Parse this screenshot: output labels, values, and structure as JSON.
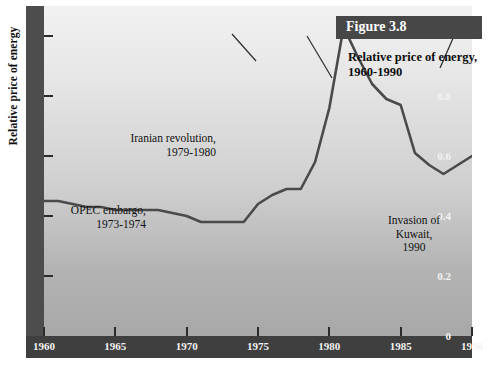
{
  "figure": {
    "tag": "Figure 3.8"
  },
  "chart_data": {
    "type": "line",
    "xlabel": "",
    "ylabel": "Relative price of energy",
    "xlim": [
      1960,
      1990
    ],
    "ylim": [
      0,
      1.1
    ],
    "grid": false,
    "legend": null,
    "y_ticks": [
      "0",
      "0.2",
      "0.4",
      "0.6",
      "0.8",
      "1.0"
    ],
    "y_tick_values": [
      0,
      0.2,
      0.4,
      0.6,
      0.8,
      1.0
    ],
    "x_ticks": [
      "1960",
      "1965",
      "1970",
      "1975",
      "1980",
      "1985",
      "1990"
    ],
    "x_tick_values": [
      1960,
      1965,
      1970,
      1975,
      1980,
      1985,
      1990
    ],
    "series": [
      {
        "name": "Relative price of energy",
        "color": "#4a4a4a",
        "x": [
          1960,
          1961,
          1962,
          1963,
          1964,
          1965,
          1966,
          1967,
          1968,
          1969,
          1970,
          1971,
          1972,
          1973,
          1974,
          1975,
          1976,
          1977,
          1978,
          1979,
          1980,
          1981,
          1982,
          1983,
          1984,
          1985,
          1986,
          1987,
          1988,
          1989,
          1990
        ],
        "values": [
          0.45,
          0.45,
          0.44,
          0.43,
          0.43,
          0.42,
          0.42,
          0.42,
          0.42,
          0.41,
          0.4,
          0.38,
          0.38,
          0.38,
          0.38,
          0.44,
          0.47,
          0.49,
          0.49,
          0.58,
          0.76,
          1.03,
          0.93,
          0.84,
          0.79,
          0.77,
          0.61,
          0.57,
          0.54,
          0.57,
          0.6
        ]
      }
    ],
    "annotations": [
      {
        "id": "opec",
        "lines": [
          "OPEC embargo,",
          "1973-1974"
        ],
        "align": "right",
        "point_x": 1973.6,
        "point_y": 0.4
      },
      {
        "id": "iran",
        "lines": [
          "Iranian revolution,",
          "1979-1980"
        ],
        "align": "right",
        "point_x": 1979.2,
        "point_y": 0.61
      },
      {
        "id": "kuwait",
        "lines": [
          "Invasion of",
          "Kuwait,",
          "1990"
        ],
        "align": "center",
        "point_x": 1990.0,
        "point_y": 0.6
      }
    ]
  }
}
